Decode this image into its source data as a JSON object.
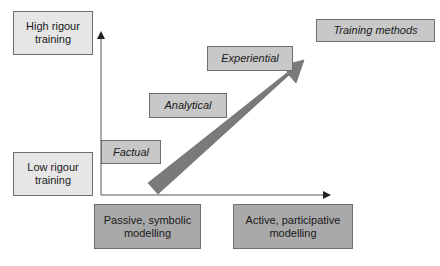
{
  "diagram": {
    "y_axis": {
      "top_label": "High rigour training",
      "bottom_label": "Low rigour training"
    },
    "x_axis": {
      "left_label": "Passive, symbolic modelling",
      "right_label": "Active, participative modelling"
    },
    "legend_title": "Training methods",
    "stages": [
      {
        "label": "Factual"
      },
      {
        "label": "Analytical"
      },
      {
        "label": "Experiential"
      }
    ],
    "colors": {
      "light_box": "#e6e6e6",
      "stage_box": "#c8c8c8",
      "axis_box": "#a9a9a9",
      "arrow_fill": "#7a7a7a",
      "axis_line": "#555555"
    }
  }
}
